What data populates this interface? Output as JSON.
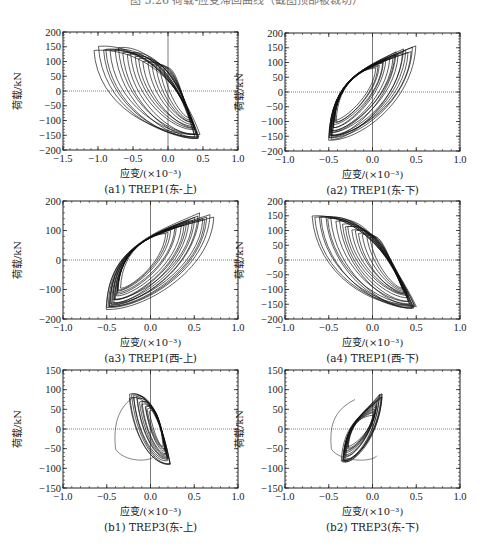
{
  "figure": {
    "top_caption": "图 5.26  荷载-应变滞回曲线（截图顶部被裁切）"
  },
  "chart_data": [
    {
      "id": "a1",
      "type": "line",
      "title": "(a1) TREP1(东-上)",
      "xlabel": "应变/(×10⁻³)",
      "ylabel": "荷载/kN",
      "xlim": [
        -1.5,
        1.0
      ],
      "ylim": [
        -200,
        200
      ],
      "xticks": [
        -1.5,
        -1.0,
        -0.5,
        0.0,
        0.5,
        1.0
      ],
      "xtick_labels": [
        "−1.5",
        "−1.0",
        "−0.5",
        "0.0",
        "0.5",
        "1.0"
      ],
      "yticks": [
        -200,
        -150,
        -100,
        -50,
        0,
        50,
        100,
        150,
        200
      ],
      "ytick_labels": [
        "−200",
        "−150",
        "−100",
        "−50",
        "0",
        "50",
        "100",
        "150",
        "200"
      ],
      "grid": false,
      "reference_lines": {
        "x0": true,
        "y0": true
      },
      "hysteresis": {
        "cycles": 18,
        "orientation": "negative",
        "strain_min": -1.05,
        "strain_max": 0.45,
        "load_min": -170,
        "load_max": 155,
        "pivot_x": 0.0,
        "pivot_y": 70,
        "pivot2_x": 0.1,
        "pivot2_y": -85
      }
    },
    {
      "id": "a2",
      "type": "line",
      "title": "(a2) TREP1(东-下)",
      "xlabel": "应变/(×10⁻³)",
      "ylabel": "荷载/kN",
      "xlim": [
        -1.0,
        1.0
      ],
      "ylim": [
        -200,
        200
      ],
      "xticks": [
        -1.0,
        -0.5,
        0.0,
        0.5,
        1.0
      ],
      "xtick_labels": [
        "−1.0",
        "−0.5",
        "0.0",
        "0.5",
        "1.0"
      ],
      "yticks": [
        -200,
        -150,
        -100,
        -50,
        0,
        50,
        100,
        150,
        200
      ],
      "ytick_labels": [
        "−200",
        "−150",
        "−100",
        "−50",
        "0",
        "50",
        "100",
        "150",
        "200"
      ],
      "grid": false,
      "reference_lines": {
        "x0": true,
        "y0": true
      },
      "hysteresis": {
        "cycles": 18,
        "orientation": "positive",
        "strain_min": -0.5,
        "strain_max": 0.5,
        "load_min": -170,
        "load_max": 158,
        "pivot_x": 0.0,
        "pivot_y": 75,
        "pivot2_x": -0.3,
        "pivot2_y": -90
      }
    },
    {
      "id": "a3",
      "type": "line",
      "title": "(a3) TREP1(西-上)",
      "xlabel": "应变/(×10⁻³)",
      "ylabel": "荷载/kN",
      "xlim": [
        -1.0,
        1.0
      ],
      "ylim": [
        -200,
        200
      ],
      "xticks": [
        -1.0,
        -0.5,
        0.0,
        0.5,
        1.0
      ],
      "xtick_labels": [
        "−1.0",
        "−0.5",
        "0.0",
        "0.5",
        "1.0"
      ],
      "yticks": [
        -200,
        -100,
        0,
        100,
        200
      ],
      "ytick_labels": [
        "−200",
        "−100",
        "0",
        "100",
        "200"
      ],
      "grid": false,
      "reference_lines": {
        "x0": true,
        "y0": true
      },
      "hysteresis": {
        "cycles": 18,
        "orientation": "positive",
        "strain_min": -0.5,
        "strain_max": 0.72,
        "load_min": -170,
        "load_max": 160,
        "pivot_x": 0.15,
        "pivot_y": 85,
        "pivot2_x": -0.1,
        "pivot2_y": -90
      }
    },
    {
      "id": "a4",
      "type": "line",
      "title": "(a4) TREP1(西-下)",
      "xlabel": "应变/(×10⁻³)",
      "ylabel": "荷载/kN",
      "xlim": [
        -1.0,
        1.0
      ],
      "ylim": [
        -200,
        200
      ],
      "xticks": [
        -1.0,
        -0.5,
        0.0,
        0.5,
        1.0
      ],
      "xtick_labels": [
        "−1.0",
        "−0.5",
        "0.0",
        "0.5",
        "1.0"
      ],
      "yticks": [
        -200,
        -150,
        -100,
        -50,
        0,
        50,
        100,
        150,
        200
      ],
      "ytick_labels": [
        "−200",
        "−150",
        "−100",
        "−50",
        "0",
        "50",
        "100",
        "150",
        "200"
      ],
      "grid": false,
      "reference_lines": {
        "x0": true,
        "y0": true
      },
      "hysteresis": {
        "cycles": 18,
        "orientation": "negative",
        "strain_min": -0.7,
        "strain_max": 0.5,
        "load_min": -170,
        "load_max": 155,
        "pivot_x": 0.0,
        "pivot_y": 70,
        "pivot2_x": 0.1,
        "pivot2_y": -90
      }
    },
    {
      "id": "b1",
      "type": "line",
      "title": "(b1) TREP3(东-上)",
      "xlabel": "应变/(×10⁻³)",
      "ylabel": "荷载/kN",
      "xlim": [
        -1.0,
        1.0
      ],
      "ylim": [
        -150,
        150
      ],
      "xticks": [
        -1.0,
        -0.5,
        0.0,
        0.5,
        1.0
      ],
      "xtick_labels": [
        "−1.0",
        "−0.5",
        "0.0",
        "0.5",
        "1.0"
      ],
      "yticks": [
        -150,
        -100,
        -50,
        0,
        50,
        100,
        150
      ],
      "ytick_labels": [
        "−150",
        "−100",
        "−50",
        "0",
        "50",
        "100",
        "150"
      ],
      "grid": false,
      "reference_lines": {
        "x0": true,
        "y0": true
      },
      "hysteresis": {
        "cycles": 14,
        "orientation": "negative",
        "strain_min": -0.25,
        "strain_max": 0.22,
        "load_min": -90,
        "load_max": 92,
        "pivot_x": 0.0,
        "pivot_y": 40,
        "pivot2_x": 0.05,
        "pivot2_y": -40,
        "outlier_loop": {
          "xmin": -0.4,
          "ymin": -85,
          "ymax": 80
        }
      }
    },
    {
      "id": "b2",
      "type": "line",
      "title": "(b2) TREP3(东-下)",
      "xlabel": "应变/(×10⁻³)",
      "ylabel": "荷载/kN",
      "xlim": [
        -1.0,
        1.0
      ],
      "ylim": [
        -150,
        150
      ],
      "xticks": [
        -1.0,
        -0.5,
        0.0,
        0.5,
        1.0
      ],
      "xtick_labels": [
        "−1.0",
        "−0.5",
        "0.0",
        "0.5",
        "1.0"
      ],
      "yticks": [
        -150,
        -100,
        -50,
        0,
        50,
        100,
        150
      ],
      "ytick_labels": [
        "−150",
        "−100",
        "−50",
        "0",
        "50",
        "100",
        "150"
      ],
      "grid": false,
      "reference_lines": {
        "x0": true,
        "y0": true
      },
      "hysteresis": {
        "cycles": 14,
        "orientation": "positive",
        "strain_min": -0.35,
        "strain_max": 0.12,
        "load_min": -88,
        "load_max": 92,
        "pivot_x": 0.0,
        "pivot_y": 30,
        "pivot2_x": -0.15,
        "pivot2_y": -40,
        "outlier_loop": {
          "xmin": -0.47,
          "ymin": -85,
          "ymax": 75
        }
      }
    }
  ],
  "layout": {
    "panels": [
      {
        "id": "a1",
        "x": 63,
        "y": 32,
        "w": 175,
        "h": 118
      },
      {
        "id": "a2",
        "x": 285,
        "y": 33,
        "w": 175,
        "h": 118
      },
      {
        "id": "a3",
        "x": 63,
        "y": 201,
        "w": 175,
        "h": 118
      },
      {
        "id": "a4",
        "x": 285,
        "y": 201,
        "w": 175,
        "h": 118
      },
      {
        "id": "b1",
        "x": 63,
        "y": 370,
        "w": 175,
        "h": 118
      },
      {
        "id": "b2",
        "x": 285,
        "y": 370,
        "w": 175,
        "h": 118
      }
    ],
    "line_color": "#111111",
    "frame_color": "#222222"
  }
}
